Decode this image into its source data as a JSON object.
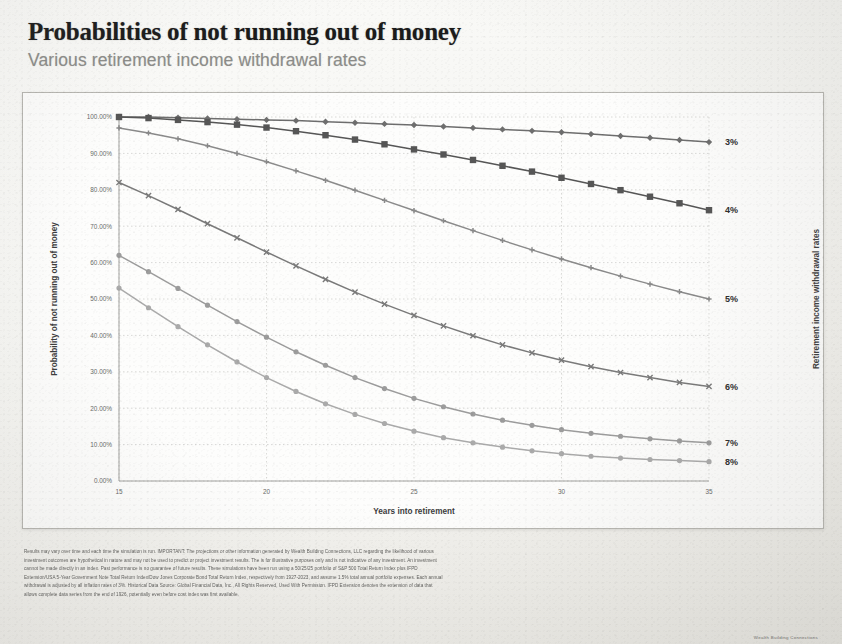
{
  "header": {
    "title": "Probabilities of not running out of money",
    "subtitle": "Various retirement income withdrawal rates"
  },
  "axis": {
    "y_left_title": "Probability of not running out of money",
    "y_right_title": "Retirement income withdrawal rates",
    "x_title": "Years into retirement"
  },
  "footer": {
    "line1": "Results may vary over time and each time the simulation is run. IMPORTANT: The projections or other information generated by Wealth Building Connections, LLC regarding the likelihood of various",
    "line2": "investment outcomes are hypothetical in nature and may not be used to predict or project investment results. The is for illustrative purposes only and is not indicative of any investment. An investment",
    "line3": "cannot be made directly in an index. Past performance is no guarantee of future results. These simulations have been run using a 50/25/25 portfolio of S&P 500 Total Return Index plus IFPD",
    "line4": "Extension/USA 5-Year Government Note Total Return Index/Dow Jones Corporate Bond Total Return Index, respectively from 1927-2023, and assume 1.5% total annual portfolio expenses. Each annual",
    "line5": "withdrawal is adjusted by all inflation rates of 3%. Historical Data Source: Global Financial Data, Inc., All Rights Reserved, Used With Permission. IFPD Extension denotes the extension of data that",
    "line6": "allows complete data series from the end of 1926, potentially even before cost index was first available.",
    "mark": "Wealth Building Connections"
  },
  "chart_data": {
    "type": "line",
    "title": "Probabilities of not running out of money",
    "subtitle": "Various retirement income withdrawal rates",
    "xlabel": "Years into retirement",
    "ylabel": "Probability of not running out of money",
    "y2label": "Retirement income withdrawal rates",
    "xlim": [
      15,
      35
    ],
    "ylim": [
      0,
      100
    ],
    "xticks": [
      15,
      20,
      25,
      30,
      35
    ],
    "yticks": [
      "0.00%",
      "10.00%",
      "20.00%",
      "30.00%",
      "40.00%",
      "50.00%",
      "60.00%",
      "70.00%",
      "80.00%",
      "90.00%",
      "100.00%"
    ],
    "grid": true,
    "legend_position": "right-of-plot-end-labels",
    "x": [
      15,
      16,
      17,
      18,
      19,
      20,
      21,
      22,
      23,
      24,
      25,
      26,
      27,
      28,
      29,
      30,
      31,
      32,
      33,
      34,
      35
    ],
    "series": [
      {
        "name": "3%",
        "color": "#6e6e6e",
        "marker": "diamond",
        "values": [
          100.0,
          100.0,
          99.8,
          99.6,
          99.4,
          99.2,
          99.0,
          98.7,
          98.4,
          98.1,
          97.8,
          97.4,
          97.0,
          96.6,
          96.2,
          95.8,
          95.3,
          94.8,
          94.3,
          93.7,
          93.1
        ]
      },
      {
        "name": "4%",
        "color": "#565656",
        "marker": "square",
        "values": [
          100.0,
          99.7,
          99.2,
          98.6,
          97.9,
          97.1,
          96.1,
          95.0,
          93.8,
          92.5,
          91.1,
          89.7,
          88.2,
          86.6,
          85.0,
          83.3,
          81.6,
          79.9,
          78.1,
          76.3,
          74.4
        ]
      },
      {
        "name": "5%",
        "color": "#8a8a8a",
        "marker": "plus",
        "values": [
          97.0,
          95.6,
          94.0,
          92.1,
          90.0,
          87.7,
          85.2,
          82.6,
          79.9,
          77.1,
          74.3,
          71.5,
          68.8,
          66.1,
          63.5,
          61.0,
          58.6,
          56.3,
          54.1,
          52.0,
          50.0
        ]
      },
      {
        "name": "6%",
        "color": "#7a7a7a",
        "marker": "cross",
        "values": [
          82.0,
          78.4,
          74.6,
          70.7,
          66.8,
          62.9,
          59.1,
          55.4,
          51.9,
          48.6,
          45.5,
          42.6,
          39.9,
          37.4,
          35.2,
          33.2,
          31.4,
          29.8,
          28.4,
          27.1,
          26.0
        ]
      },
      {
        "name": "7%",
        "color": "#9c9c9c",
        "marker": "circle",
        "values": [
          62.0,
          57.5,
          52.9,
          48.3,
          43.8,
          39.5,
          35.5,
          31.8,
          28.4,
          25.4,
          22.7,
          20.4,
          18.4,
          16.7,
          15.3,
          14.1,
          13.1,
          12.3,
          11.6,
          11.0,
          10.5
        ]
      },
      {
        "name": "8%",
        "color": "#aaaaaa",
        "marker": "circle",
        "values": [
          53.0,
          47.6,
          42.4,
          37.4,
          32.7,
          28.4,
          24.6,
          21.2,
          18.3,
          15.8,
          13.7,
          11.9,
          10.5,
          9.3,
          8.3,
          7.5,
          6.8,
          6.3,
          5.9,
          5.6,
          5.3
        ]
      }
    ]
  }
}
